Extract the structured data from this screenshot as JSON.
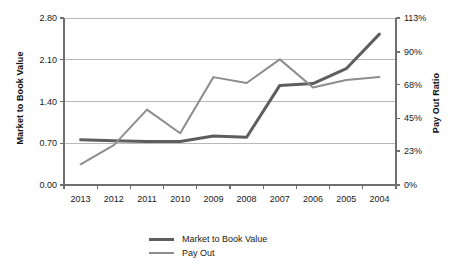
{
  "chart_data": {
    "type": "line",
    "title": "",
    "xlabel": "",
    "ylabel": "Market to Book Value",
    "y2label": "Pay Out Ratio",
    "categories": [
      "2013",
      "2012",
      "2011",
      "2010",
      "2009",
      "2008",
      "2007",
      "2006",
      "2005",
      "2004"
    ],
    "ylim": [
      0.0,
      2.8
    ],
    "y2lim": [
      0,
      113
    ],
    "yticks": [
      "0.00",
      "0.70",
      "1.40",
      "2.10",
      "2.80"
    ],
    "ytick_values": [
      0.0,
      0.7,
      1.4,
      2.1,
      2.8
    ],
    "y2ticks": [
      "0%",
      "23%",
      "45%",
      "68%",
      "90%",
      "113%"
    ],
    "y2tick_values": [
      0,
      23,
      45,
      68,
      90,
      113
    ],
    "grid": true,
    "legend_position": "bottom",
    "series": [
      {
        "name": "Market to Book Value",
        "axis": "left",
        "color": "#5e5e5e",
        "width": 3,
        "values": [
          0.76,
          0.74,
          0.73,
          0.73,
          0.82,
          0.8,
          1.67,
          1.7,
          1.95,
          2.53
        ]
      },
      {
        "name": "Pay Out",
        "axis": "right",
        "color": "#8d8d8d",
        "width": 2,
        "values": [
          14,
          27,
          51,
          35,
          73,
          69,
          85,
          66,
          71,
          73
        ]
      }
    ]
  },
  "legend": {
    "items": [
      {
        "label": "Market to Book Value"
      },
      {
        "label": "Pay Out"
      }
    ]
  },
  "colors": {
    "market_to_book": "#5e5e5e",
    "pay_out": "#8d8d8d",
    "grid": "#b9b9b9",
    "axis": "#6f6f6f",
    "text": "#1a1a1a"
  }
}
